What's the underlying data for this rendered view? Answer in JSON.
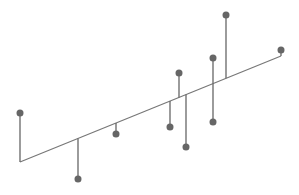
{
  "chart_data": {
    "type": "scatter",
    "title": "",
    "xlabel": "",
    "ylabel": "",
    "grid": false,
    "legend": null,
    "colors": {
      "point": "#666666",
      "stem": "#666666",
      "line": "#777777",
      "background": "#ffffff"
    },
    "regression_line": {
      "x0": 20,
      "y0": 162,
      "x1": 281,
      "y1": 56
    },
    "points": [
      {
        "x": 20,
        "y": 113
      },
      {
        "x": 78,
        "y": 179
      },
      {
        "x": 116,
        "y": 134
      },
      {
        "x": 170,
        "y": 127
      },
      {
        "x": 179,
        "y": 73
      },
      {
        "x": 186,
        "y": 147
      },
      {
        "x": 213,
        "y": 58
      },
      {
        "x": 213,
        "y": 122
      },
      {
        "x": 226,
        "y": 15
      },
      {
        "x": 281,
        "y": 50
      }
    ]
  }
}
